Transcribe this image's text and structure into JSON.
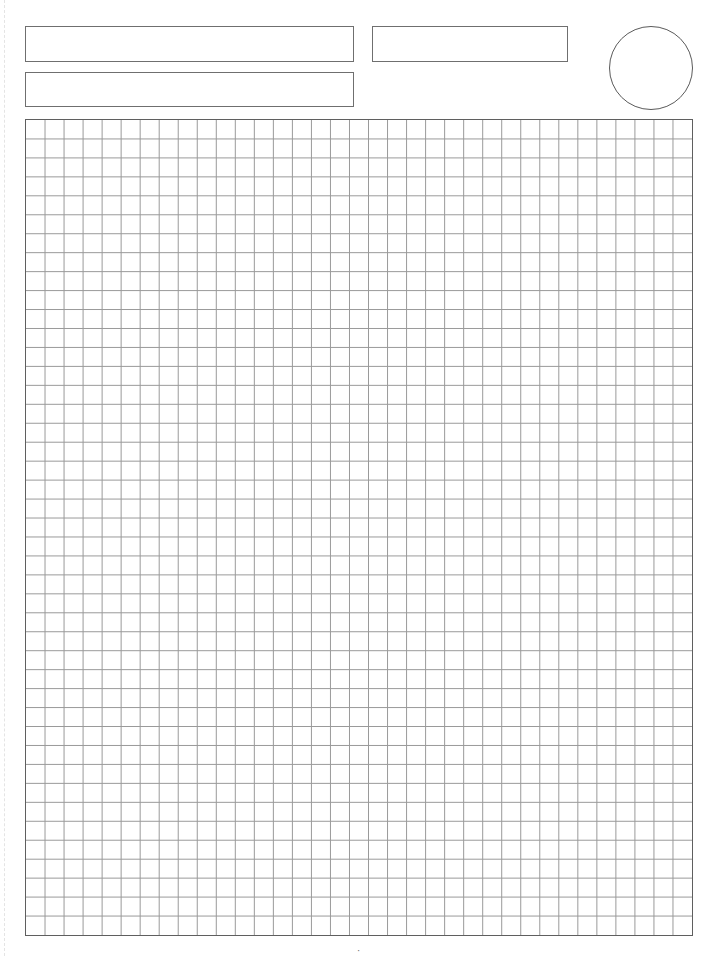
{
  "page": {
    "type": "grid-paper worksheet",
    "background_color": "#ffffff",
    "line_color": "#9a9a9a",
    "border_color": "#5f5f5f"
  },
  "header": {
    "fields": [
      {
        "id": "box-name",
        "label": "",
        "value": ""
      },
      {
        "id": "box-date",
        "label": "",
        "value": ""
      },
      {
        "id": "box-subject",
        "label": "",
        "value": ""
      }
    ],
    "circle_mark": {
      "value": ""
    }
  },
  "grid": {
    "columns": 35,
    "rows": 43,
    "cell_size_px": 19
  },
  "footer": {
    "page_mark": "·"
  }
}
